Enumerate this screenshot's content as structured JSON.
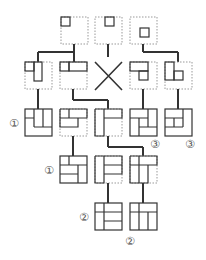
{
  "diagram": {
    "title": "",
    "colors": {
      "line": "#333333",
      "dotted": "#999999",
      "label": "#555555",
      "background": "#ffffff"
    },
    "labels": [
      {
        "id": "label-1a",
        "text": "①",
        "x": 9,
        "y": 127
      },
      {
        "id": "label-1b",
        "text": "①",
        "x": 44,
        "y": 174
      },
      {
        "id": "label-3a",
        "text": "③",
        "x": 150,
        "y": 148
      },
      {
        "id": "label-3b",
        "text": "③",
        "x": 185,
        "y": 148
      },
      {
        "id": "label-2a",
        "text": "②",
        "x": 79,
        "y": 221
      },
      {
        "id": "label-2b",
        "text": "②",
        "x": 125,
        "y": 245
      }
    ]
  }
}
